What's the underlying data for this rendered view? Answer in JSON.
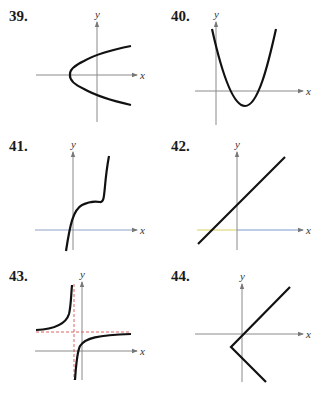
{
  "problems": [
    {
      "number": "39.",
      "x_label": "x",
      "y_label": "y",
      "curve": "sideways parabola opening right, vertex left of origin on x-axis"
    },
    {
      "number": "40.",
      "x_label": "x",
      "y_label": "y",
      "curve": "upward parabola, vertex below x-axis right of origin"
    },
    {
      "number": "41.",
      "x_label": "x",
      "y_label": "y",
      "curve": "cubic with inflection plateau above x-axis"
    },
    {
      "number": "42.",
      "x_label": "x",
      "y_label": "y",
      "curve": "straight line with positive slope, positive y-intercept"
    },
    {
      "number": "43.",
      "x_label": "x",
      "y_label": "y",
      "curve": "rational function with dashed vertical and horizontal asymptotes"
    },
    {
      "number": "44.",
      "x_label": "x",
      "y_label": "y",
      "curve": "V-shaped absolute value graph opening right, vertex below-left of origin"
    }
  ],
  "colors": {
    "axis": "#8a8a8a",
    "curve": "#111111",
    "asymptote": "#d9534f",
    "axis_tint_yellow": "#d8d060",
    "axis_tint_blue": "#7a9ad0"
  }
}
